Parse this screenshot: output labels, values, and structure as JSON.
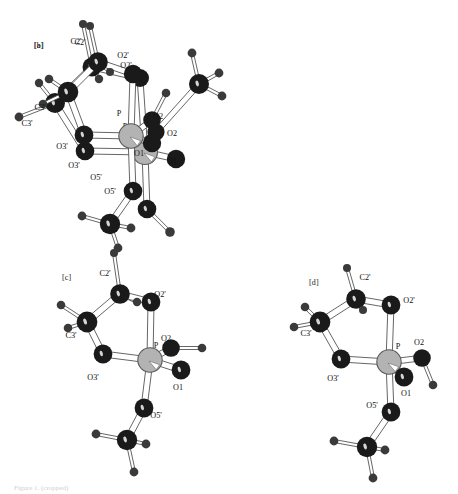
{
  "figure": {
    "background_color": "#ffffff",
    "width": 458,
    "height": 494,
    "caption": "Figure 1. (cropped)",
    "colors": {
      "carbon_oxygen": "#1a1a1a",
      "hydrogen": "#3a3a3a",
      "phosphorus_fill": "#b3b3b3",
      "phosphorus_stroke": "#5a5a5a",
      "bond_fill": "#ffffff",
      "bond_stroke": "#4a4a4a",
      "label_color": "#111111"
    },
    "panels": [
      {
        "id": "a",
        "tag": "[a]",
        "tag_x": 34,
        "tag_y": 41,
        "labels": [
          {
            "text": "C2'",
            "x": 76,
            "y": 44
          },
          {
            "text": "O2'",
            "x": 123,
            "y": 58
          },
          {
            "text": "C3'",
            "x": 27,
            "y": 126
          },
          {
            "text": "P",
            "x": 125,
            "y": 129
          },
          {
            "text": "O2",
            "x": 172,
            "y": 136
          },
          {
            "text": "O3'",
            "x": 74,
            "y": 168
          },
          {
            "text": "O1",
            "x": 172,
            "y": 164
          },
          {
            "text": "O5'",
            "x": 110,
            "y": 194
          }
        ],
        "atoms": [
          {
            "name": "H-on-C2'",
            "x": 83,
            "y": 24,
            "r": 4.0,
            "kind": "h"
          },
          {
            "name": "C2'",
            "x": 92,
            "y": 67,
            "r": 9.5,
            "kind": "c"
          },
          {
            "name": "H-C2'b",
            "x": 99,
            "y": 79,
            "r": 4.2,
            "kind": "h"
          },
          {
            "name": "O2'",
            "x": 140,
            "y": 78,
            "r": 9.0,
            "kind": "c"
          },
          {
            "name": "C3'",
            "x": 55,
            "y": 103,
            "r": 10.0,
            "kind": "c"
          },
          {
            "name": "H-C3'a",
            "x": 39,
            "y": 83,
            "r": 4.2,
            "kind": "h"
          },
          {
            "name": "H-C3'b",
            "x": 19,
            "y": 117,
            "r": 4.4,
            "kind": "h"
          },
          {
            "name": "O3'",
            "x": 85,
            "y": 151,
            "r": 9.3,
            "kind": "c"
          },
          {
            "name": "P",
            "x": 145,
            "y": 152,
            "r": 12.5,
            "kind": "p"
          },
          {
            "name": "O1",
            "x": 176,
            "y": 159,
            "r": 9.2,
            "kind": "c"
          },
          {
            "name": "O2",
            "x": 156,
            "y": 132,
            "r": 8.6,
            "kind": "c"
          },
          {
            "name": "C-ester2",
            "x": 199,
            "y": 84,
            "r": 10.0,
            "kind": "c"
          },
          {
            "name": "H-e2a",
            "x": 192,
            "y": 53,
            "r": 4.4,
            "kind": "h"
          },
          {
            "name": "H-e2b",
            "x": 219,
            "y": 73,
            "r": 4.4,
            "kind": "h"
          },
          {
            "name": "H-e2c",
            "x": 222,
            "y": 96,
            "r": 4.4,
            "kind": "h"
          },
          {
            "name": "O5'",
            "x": 147,
            "y": 209,
            "r": 9.3,
            "kind": "c"
          },
          {
            "name": "C5'",
            "x": 170,
            "y": 232,
            "r": 4.8,
            "kind": "h"
          }
        ],
        "bonds": [
          [
            "H-on-C2'",
            "C2'"
          ],
          [
            "C2'",
            "H-C2'b"
          ],
          [
            "C2'",
            "O2'"
          ],
          [
            "C2'",
            "C3'"
          ],
          [
            "C3'",
            "H-C3'a"
          ],
          [
            "C3'",
            "H-C3'b"
          ],
          [
            "C3'",
            "O3'"
          ],
          [
            "O2'",
            "P"
          ],
          [
            "O3'",
            "P"
          ],
          [
            "P",
            "O1"
          ],
          [
            "P",
            "O2"
          ],
          [
            "P",
            "O5'"
          ],
          [
            "O2",
            "C-ester2"
          ],
          [
            "C-ester2",
            "H-e2a"
          ],
          [
            "C-ester2",
            "H-e2b"
          ],
          [
            "C-ester2",
            "H-e2c"
          ],
          [
            "O5'",
            "C5'"
          ]
        ]
      },
      {
        "id": "b",
        "tag": "[b]",
        "tag_x": 34,
        "tag_y": 41,
        "labels": [
          {
            "text": "C2'",
            "x": 80,
            "y": 45
          },
          {
            "text": "O2'",
            "x": 126,
            "y": 68
          },
          {
            "text": "C3'",
            "x": 40,
            "y": 110
          },
          {
            "text": "P",
            "x": 119,
            "y": 116
          },
          {
            "text": "O2",
            "x": 158,
            "y": 119
          },
          {
            "text": "O3'",
            "x": 62,
            "y": 149
          },
          {
            "text": "O1",
            "x": 139,
            "y": 156
          },
          {
            "text": "O5'",
            "x": 96,
            "y": 180
          }
        ],
        "atoms": [
          {
            "name": "H-on-C2'",
            "x": 90,
            "y": 26,
            "r": 4.0,
            "kind": "h"
          },
          {
            "name": "C2'",
            "x": 98,
            "y": 62,
            "r": 9.8,
            "kind": "c"
          },
          {
            "name": "H-C2'b",
            "x": 110,
            "y": 72,
            "r": 4.0,
            "kind": "h"
          },
          {
            "name": "O2'",
            "x": 133,
            "y": 74,
            "r": 9.2,
            "kind": "c"
          },
          {
            "name": "C3'",
            "x": 68,
            "y": 92,
            "r": 10.3,
            "kind": "c"
          },
          {
            "name": "H-C3'a",
            "x": 49,
            "y": 79,
            "r": 4.3,
            "kind": "h"
          },
          {
            "name": "H-C3'b",
            "x": 43,
            "y": 104,
            "r": 4.3,
            "kind": "h"
          },
          {
            "name": "O3'",
            "x": 84,
            "y": 135,
            "r": 9.4,
            "kind": "c"
          },
          {
            "name": "P",
            "x": 131,
            "y": 136,
            "r": 12.2,
            "kind": "p"
          },
          {
            "name": "O1",
            "x": 152,
            "y": 143,
            "r": 9.2,
            "kind": "c"
          },
          {
            "name": "O2",
            "x": 152,
            "y": 120,
            "r": 8.8,
            "kind": "c"
          },
          {
            "name": "H-o2",
            "x": 166,
            "y": 93,
            "r": 4.3,
            "kind": "h"
          },
          {
            "name": "O5'",
            "x": 133,
            "y": 191,
            "r": 9.3,
            "kind": "c"
          },
          {
            "name": "C5'",
            "x": 110,
            "y": 224,
            "r": 10.2,
            "kind": "c"
          },
          {
            "name": "H-c5a",
            "x": 82,
            "y": 216,
            "r": 4.4,
            "kind": "h"
          },
          {
            "name": "H-c5b",
            "x": 131,
            "y": 228,
            "r": 4.4,
            "kind": "h"
          },
          {
            "name": "H-c5c",
            "x": 118,
            "y": 248,
            "r": 4.4,
            "kind": "h"
          }
        ],
        "bonds": [
          [
            "H-on-C2'",
            "C2'"
          ],
          [
            "C2'",
            "H-C2'b"
          ],
          [
            "C2'",
            "O2'"
          ],
          [
            "C2'",
            "C3'"
          ],
          [
            "C3'",
            "H-C3'a"
          ],
          [
            "C3'",
            "H-C3'b"
          ],
          [
            "C3'",
            "O3'"
          ],
          [
            "O2'",
            "P"
          ],
          [
            "O3'",
            "P"
          ],
          [
            "P",
            "O1"
          ],
          [
            "P",
            "O2"
          ],
          [
            "P",
            "O5'"
          ],
          [
            "O2",
            "H-o2"
          ],
          [
            "O5'",
            "C5'"
          ],
          [
            "C5'",
            "H-c5a"
          ],
          [
            "C5'",
            "H-c5b"
          ],
          [
            "C5'",
            "H-c5c"
          ]
        ]
      },
      {
        "id": "c",
        "tag": "[c]",
        "tag_x": 62,
        "tag_y": 273,
        "labels": [
          {
            "text": "C2'",
            "x": 105,
            "y": 276
          },
          {
            "text": "O2'",
            "x": 160,
            "y": 297
          },
          {
            "text": "C3'",
            "x": 71,
            "y": 338
          },
          {
            "text": "O2",
            "x": 166,
            "y": 341
          },
          {
            "text": "P",
            "x": 156,
            "y": 348
          },
          {
            "text": "O3'",
            "x": 93,
            "y": 380
          },
          {
            "text": "O1",
            "x": 178,
            "y": 390
          },
          {
            "text": "O5'",
            "x": 156,
            "y": 418
          }
        ],
        "atoms": [
          {
            "name": "H-on-C2'",
            "x": 114,
            "y": 253,
            "r": 4.0,
            "kind": "h"
          },
          {
            "name": "C2'",
            "x": 120,
            "y": 294,
            "r": 9.8,
            "kind": "c"
          },
          {
            "name": "H-C2'b",
            "x": 137,
            "y": 302,
            "r": 4.2,
            "kind": "h"
          },
          {
            "name": "O2'",
            "x": 151,
            "y": 302,
            "r": 9.4,
            "kind": "c"
          },
          {
            "name": "C3'",
            "x": 87,
            "y": 322,
            "r": 10.4,
            "kind": "c"
          },
          {
            "name": "H-C3'a",
            "x": 61,
            "y": 305,
            "r": 4.3,
            "kind": "h"
          },
          {
            "name": "H-C3'b",
            "x": 68,
            "y": 328,
            "r": 4.3,
            "kind": "h"
          },
          {
            "name": "O3'",
            "x": 103,
            "y": 354,
            "r": 9.4,
            "kind": "c"
          },
          {
            "name": "P",
            "x": 150,
            "y": 360,
            "r": 12.2,
            "kind": "p"
          },
          {
            "name": "O2",
            "x": 171,
            "y": 348,
            "r": 8.8,
            "kind": "c"
          },
          {
            "name": "H-o2",
            "x": 202,
            "y": 348,
            "r": 4.3,
            "kind": "h"
          },
          {
            "name": "O1",
            "x": 181,
            "y": 370,
            "r": 9.4,
            "kind": "c"
          },
          {
            "name": "O5'",
            "x": 144,
            "y": 408,
            "r": 9.4,
            "kind": "c"
          },
          {
            "name": "C5'",
            "x": 127,
            "y": 440,
            "r": 10.2,
            "kind": "c"
          },
          {
            "name": "H-c5a",
            "x": 96,
            "y": 434,
            "r": 4.4,
            "kind": "h"
          },
          {
            "name": "H-c5b",
            "x": 146,
            "y": 444,
            "r": 4.4,
            "kind": "h"
          },
          {
            "name": "H-c5c",
            "x": 134,
            "y": 472,
            "r": 4.4,
            "kind": "h"
          }
        ],
        "bonds": [
          [
            "H-on-C2'",
            "C2'"
          ],
          [
            "C2'",
            "H-C2'b"
          ],
          [
            "C2'",
            "O2'"
          ],
          [
            "C2'",
            "C3'"
          ],
          [
            "C3'",
            "H-C3'a"
          ],
          [
            "C3'",
            "H-C3'b"
          ],
          [
            "C3'",
            "O3'"
          ],
          [
            "O2'",
            "P"
          ],
          [
            "O3'",
            "P"
          ],
          [
            "P",
            "O1"
          ],
          [
            "P",
            "O2"
          ],
          [
            "P",
            "O5'"
          ],
          [
            "O2",
            "H-o2"
          ],
          [
            "O5'",
            "C5'"
          ],
          [
            "C5'",
            "H-c5a"
          ],
          [
            "C5'",
            "H-c5b"
          ],
          [
            "C5'",
            "H-c5c"
          ]
        ]
      },
      {
        "id": "d",
        "tag": "[d]",
        "tag_x": 309,
        "tag_y": 278,
        "labels": [
          {
            "text": "C2'",
            "x": 365,
            "y": 280
          },
          {
            "text": "O2'",
            "x": 409,
            "y": 303
          },
          {
            "text": "C3'",
            "x": 306,
            "y": 336
          },
          {
            "text": "O2",
            "x": 419,
            "y": 345
          },
          {
            "text": "P",
            "x": 398,
            "y": 349
          },
          {
            "text": "O3'",
            "x": 333,
            "y": 381
          },
          {
            "text": "O1",
            "x": 406,
            "y": 396
          },
          {
            "text": "O5'",
            "x": 372,
            "y": 408
          }
        ],
        "atoms": [
          {
            "name": "H-on-C2'",
            "x": 347,
            "y": 268,
            "r": 4.0,
            "kind": "h"
          },
          {
            "name": "C2'",
            "x": 356,
            "y": 299,
            "r": 9.8,
            "kind": "c"
          },
          {
            "name": "H-C2'b",
            "x": 363,
            "y": 310,
            "r": 4.0,
            "kind": "h"
          },
          {
            "name": "O2'",
            "x": 391,
            "y": 305,
            "r": 9.4,
            "kind": "c"
          },
          {
            "name": "C3'",
            "x": 320,
            "y": 322,
            "r": 10.4,
            "kind": "c"
          },
          {
            "name": "H-C3'a",
            "x": 305,
            "y": 307,
            "r": 4.3,
            "kind": "h"
          },
          {
            "name": "H-C3'b",
            "x": 294,
            "y": 327,
            "r": 4.3,
            "kind": "h"
          },
          {
            "name": "O3'",
            "x": 341,
            "y": 359,
            "r": 9.4,
            "kind": "c"
          },
          {
            "name": "P",
            "x": 389,
            "y": 362,
            "r": 12.2,
            "kind": "p"
          },
          {
            "name": "O2",
            "x": 422,
            "y": 358,
            "r": 8.8,
            "kind": "c"
          },
          {
            "name": "H-o2",
            "x": 433,
            "y": 385,
            "r": 4.3,
            "kind": "h"
          },
          {
            "name": "O1",
            "x": 404,
            "y": 377,
            "r": 9.4,
            "kind": "c"
          },
          {
            "name": "O5'",
            "x": 391,
            "y": 412,
            "r": 9.4,
            "kind": "c"
          },
          {
            "name": "C5'",
            "x": 367,
            "y": 447,
            "r": 10.2,
            "kind": "c"
          },
          {
            "name": "H-c5a",
            "x": 334,
            "y": 441,
            "r": 4.4,
            "kind": "h"
          },
          {
            "name": "H-c5b",
            "x": 385,
            "y": 450,
            "r": 4.4,
            "kind": "h"
          },
          {
            "name": "H-c5c",
            "x": 373,
            "y": 478,
            "r": 4.4,
            "kind": "h"
          }
        ],
        "bonds": [
          [
            "H-on-C2'",
            "C2'"
          ],
          [
            "C2'",
            "H-C2'b"
          ],
          [
            "C2'",
            "O2'"
          ],
          [
            "C2'",
            "C3'"
          ],
          [
            "C3'",
            "H-C3'a"
          ],
          [
            "C3'",
            "H-C3'b"
          ],
          [
            "C3'",
            "O3'"
          ],
          [
            "O2'",
            "P"
          ],
          [
            "O3'",
            "P"
          ],
          [
            "P",
            "O1"
          ],
          [
            "P",
            "O2"
          ],
          [
            "P",
            "O5'"
          ],
          [
            "O2",
            "H-o2"
          ],
          [
            "O5'",
            "C5'"
          ],
          [
            "C5'",
            "H-c5a"
          ],
          [
            "C5'",
            "H-c5b"
          ],
          [
            "C5'",
            "H-c5c"
          ]
        ]
      }
    ]
  }
}
